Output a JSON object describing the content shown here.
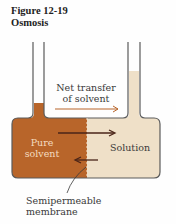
{
  "figure": {
    "number": "Figure 12-19",
    "title": "Osmosis"
  },
  "labels": {
    "net_transfer_line1": "Net transfer",
    "net_transfer_line2": "of solvent",
    "pure_solvent_line1": "Pure",
    "pure_solvent_line2": "solvent",
    "solution": "Solution",
    "membrane_line1": "Semipermeable",
    "membrane_line2": "membrane"
  },
  "colors": {
    "solvent": "#b8652a",
    "solution": "#efe0c8",
    "outline": "#5a5a5a",
    "arrow": "#5a2a1a",
    "text": "#3a3a3a"
  }
}
